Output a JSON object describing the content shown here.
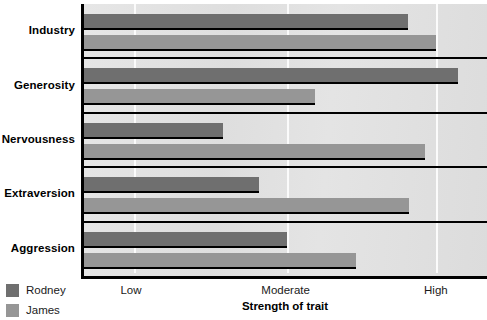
{
  "chart_data": {
    "type": "bar",
    "orientation": "horizontal",
    "title": "",
    "xlabel": "Strength of trait",
    "ylabel": "",
    "categories": [
      "Industry",
      "Generosity",
      "Nervousness",
      "Extraversion",
      "Aggression"
    ],
    "tick_labels": [
      "Low",
      "Moderate",
      "High"
    ],
    "tick_positions_pct": [
      12.3,
      50.4,
      87.4
    ],
    "xlim": [
      0,
      100
    ],
    "grid": true,
    "legend_position": "bottom-left",
    "series": [
      {
        "name": "Rodney",
        "color": "#6f6f6f",
        "values": [
          80.5,
          92.8,
          34.6,
          43.5,
          50.4
        ]
      },
      {
        "name": "James",
        "color": "#969696",
        "values": [
          87.4,
          57.3,
          84.7,
          80.7,
          67.4
        ]
      }
    ]
  },
  "legend": {
    "items": [
      {
        "label": "Rodney",
        "color": "#6f6f6f"
      },
      {
        "label": "James",
        "color": "#969696"
      }
    ]
  },
  "colors": {
    "plot_background": "#e3e3e3",
    "axis": "#000000",
    "gridline": "#fbfbfb",
    "rodney": "#6f6f6f",
    "james": "#969696"
  }
}
